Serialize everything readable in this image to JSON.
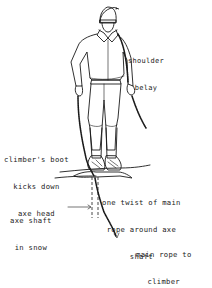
{
  "figure": {
    "colors": {
      "ink": "#1a1a1a",
      "background": "#ffffff"
    },
    "labels": {
      "shoulder_belay": {
        "line1": "shoulder",
        "line2": "belay"
      },
      "boot_kicks": {
        "line1": "climber's boot",
        "line2": "kicks down",
        "line3": "axe head"
      },
      "twist": {
        "line1": "one twist of main",
        "line2": "rope around axe",
        "line3": "shaft"
      },
      "axe_shaft": {
        "line1": "axe shaft",
        "line2": "in snow"
      },
      "main_rope": {
        "line1": "main rope to",
        "line2": "climber"
      }
    }
  }
}
